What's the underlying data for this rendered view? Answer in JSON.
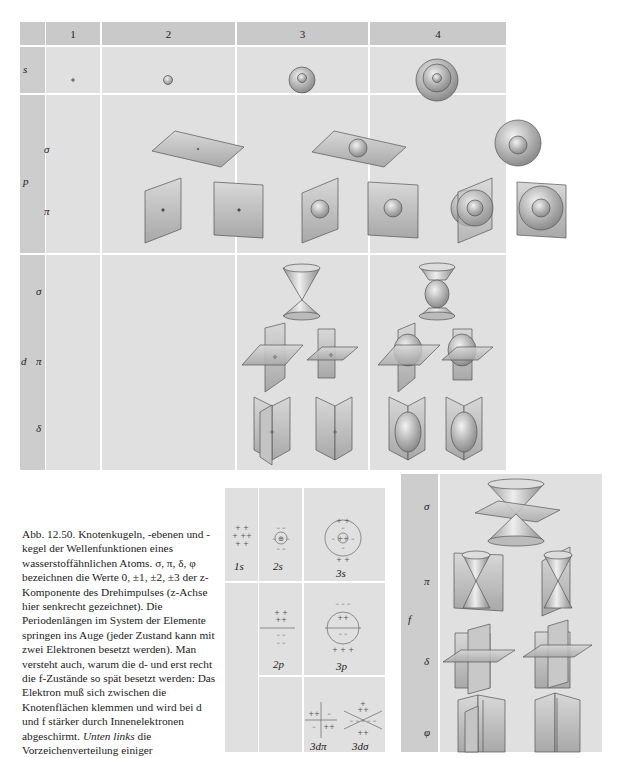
{
  "table": {
    "columns": [
      "",
      "1",
      "2",
      "3",
      "4"
    ],
    "rows": {
      "s": {
        "label": "s"
      },
      "p": {
        "label": "p",
        "sub": [
          "σ",
          "π"
        ]
      },
      "d": {
        "label": "d",
        "sub": [
          "σ",
          "π",
          "δ"
        ]
      }
    }
  },
  "small_grid": {
    "labels": [
      "1s",
      "2s",
      "3s",
      "2p",
      "3p",
      "3dπ",
      "3dσ"
    ]
  },
  "f_panel": {
    "label": "f",
    "sub": [
      "σ",
      "π",
      "δ",
      "φ"
    ]
  },
  "caption": {
    "prefix": "Abb. 12.50.",
    "text": "Knotenkugeln, -ebenen und -kegel der Wellenfunktionen eines wasserstoffähnlichen Atoms. σ, π, δ, φ bezeichnen die Werte 0, ±1, ±2, ±3 der z-Komponente des Drehimpulses (z-Achse hier senkrecht gezeichnet). Die Periodenlängen im System der Elemente springen ins Auge (jeder Zustand kann mit zwei Elektronen besetzt werden). Man versteht auch, warum die d- und erst recht die f-Zustände so spät besetzt werden: Das Elektron muß sich zwischen die Knotenflächen klemmen und wird bei d und f stärker durch Innenelektronen abgeschirmt.",
    "tail_italic": "Unten links",
    "tail": "die Vorzeichenverteilung einiger"
  },
  "colors": {
    "header": "#c9c9c9",
    "cell": "#e0e0e0",
    "label": "#cdcdcd",
    "line": "#555555"
  }
}
